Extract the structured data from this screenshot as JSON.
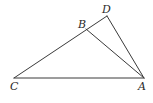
{
  "diagram": {
    "type": "geometry",
    "points": {
      "A": {
        "label": "A",
        "x": 144,
        "y": 78,
        "lx": 138,
        "ly": 90
      },
      "B": {
        "label": "B",
        "x": 86,
        "y": 29,
        "lx": 78,
        "ly": 28
      },
      "C": {
        "label": "C",
        "x": 14,
        "y": 78,
        "lx": 10,
        "ly": 90
      },
      "D": {
        "label": "D",
        "x": 107,
        "y": 16,
        "lx": 102,
        "ly": 13
      }
    },
    "segments": [
      {
        "from": "C",
        "to": "D"
      },
      {
        "from": "C",
        "to": "A"
      },
      {
        "from": "B",
        "to": "A"
      },
      {
        "from": "D",
        "to": "A"
      }
    ],
    "colors": {
      "stroke": "#3a3a3a",
      "label": "#2a2a2a",
      "background": "#ffffff"
    }
  }
}
